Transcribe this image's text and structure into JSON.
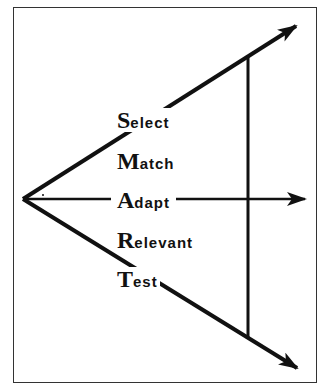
{
  "diagram": {
    "items": [
      {
        "initial": "S",
        "rest": "elect"
      },
      {
        "initial": "M",
        "rest": "atch"
      },
      {
        "initial": "A",
        "rest": "dapt"
      },
      {
        "initial": "R",
        "rest": "elevant"
      },
      {
        "initial": "T",
        "rest": "est"
      }
    ],
    "arrows": [
      {
        "name": "upper-arrow",
        "from": [
          23,
          199
        ],
        "to": [
          298,
          24
        ]
      },
      {
        "name": "middle-arrow",
        "from": [
          23,
          199
        ],
        "to": [
          307,
          199
        ]
      },
      {
        "name": "lower-arrow",
        "from": [
          23,
          199
        ],
        "to": [
          299,
          370
        ]
      }
    ],
    "connector": {
      "x": 248,
      "y1": 56,
      "y2": 337
    },
    "colors": {
      "stroke": "#111111",
      "border": "#333333",
      "background": "#ffffff"
    }
  }
}
